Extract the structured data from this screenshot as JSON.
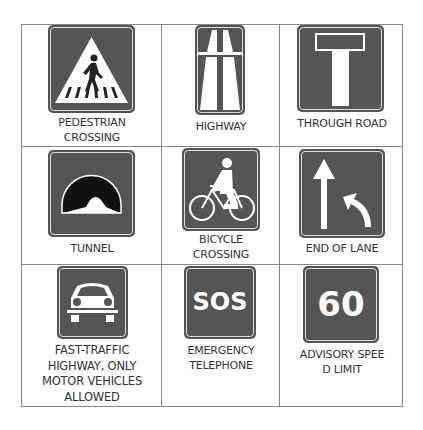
{
  "signs": [
    {
      "id": "pedestrian-crossing",
      "label_lines": [
        "PEDESTRIAN",
        "CROSSING"
      ],
      "icon": "pedestrian-crossing-icon"
    },
    {
      "id": "highway",
      "label_lines": [
        "HIGHWAY"
      ],
      "icon": "highway-icon"
    },
    {
      "id": "through-road",
      "label_lines": [
        "THROUGH ROAD"
      ],
      "icon": "through-road-icon"
    },
    {
      "id": "tunnel",
      "label_lines": [
        "TUNNEL"
      ],
      "icon": "tunnel-icon"
    },
    {
      "id": "bicycle-crossing",
      "label_lines": [
        "BICYCLE",
        "CROSSING"
      ],
      "icon": "bicycle-icon"
    },
    {
      "id": "end-of-lane",
      "label_lines": [
        "END OF LANE"
      ],
      "icon": "end-of-lane-icon"
    },
    {
      "id": "fast-traffic-highway",
      "label_lines": [
        "FAST-TRAFFIC",
        "HIGHWAY, ONLY",
        "MOTOR VEHICLES",
        "ALLOWED"
      ],
      "icon": "car-icon"
    },
    {
      "id": "emergency-telephone",
      "label_lines": [
        "EMERGENCY",
        "TELEPHONE"
      ],
      "icon": "sos-icon",
      "sign_text": "SOS"
    },
    {
      "id": "advisory-speed-limit",
      "label_lines": [
        "ADVISORY SPEE",
        "D LIMIT"
      ],
      "icon": "speed-60-icon",
      "sign_text": "60"
    }
  ],
  "colors": {
    "sign_background": "#555555",
    "sign_symbol": "#ffffff",
    "label_text": "#333333",
    "grid_lines": "#888888"
  }
}
